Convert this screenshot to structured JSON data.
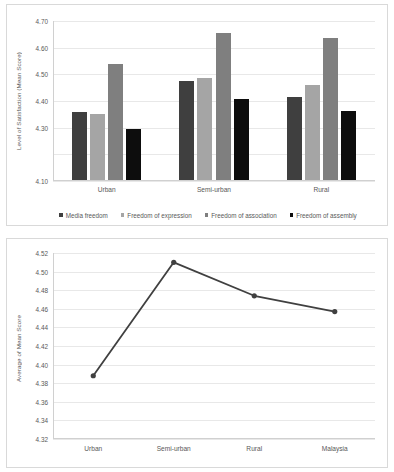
{
  "chart_data": [
    {
      "type": "bar",
      "title": "",
      "xlabel": "",
      "ylabel": "Level of Satisfaction (Mean Score)",
      "ylim": [
        4.1,
        4.7
      ],
      "ytick_step": 0.1,
      "ytick_labels": [
        "4.70",
        "4.60",
        "4.50",
        "4.40",
        "4.30",
        "4.10"
      ],
      "yticks": [
        4.7,
        4.6,
        4.5,
        4.4,
        4.3,
        4.2,
        4.1
      ],
      "grid": true,
      "legend_position": "bottom",
      "categories": [
        "Urban",
        "Semi-urban",
        "Rural"
      ],
      "series": [
        {
          "name": "Media freedom",
          "color": "#3f3f3f",
          "values": [
            4.357,
            4.475,
            4.416
          ]
        },
        {
          "name": "Freedom of expression",
          "color": "#a5a5a5",
          "values": [
            4.35,
            4.487,
            4.461
          ]
        },
        {
          "name": "Freedom of association",
          "color": "#7f7f7f",
          "values": [
            4.539,
            4.656,
            4.637
          ]
        },
        {
          "name": "Freedom of assembly",
          "color": "#0d0d0d",
          "values": [
            4.295,
            4.406,
            4.362
          ]
        }
      ]
    },
    {
      "type": "line",
      "title": "",
      "xlabel": "",
      "ylabel": "Average of Mean Score",
      "ylim": [
        4.32,
        4.52
      ],
      "ytick_step": 0.02,
      "yticks": [
        4.52,
        4.5,
        4.48,
        4.46,
        4.44,
        4.42,
        4.4,
        4.38,
        4.36,
        4.34,
        4.32
      ],
      "grid": true,
      "legend_position": "none",
      "categories": [
        "Urban",
        "Semi-urban",
        "Rural",
        "Malaysia"
      ],
      "series": [
        {
          "name": "Average of Mean Score",
          "color": "#404040",
          "values": [
            4.388,
            4.51,
            4.474,
            4.457
          ]
        }
      ]
    }
  ]
}
